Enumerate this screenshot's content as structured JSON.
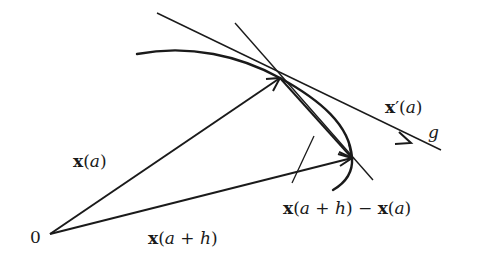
{
  "diagram": {
    "type": "vector-geometry",
    "stroke_color": "#1a1a1a",
    "points": {
      "origin": {
        "label": "0",
        "x": 50,
        "y": 234
      },
      "A": {
        "meaning": "x(a)",
        "x": 280,
        "y": 78
      },
      "B": {
        "meaning": "x(a+h)",
        "x": 352,
        "y": 158
      }
    },
    "labels": {
      "origin": "0",
      "x_a": {
        "bold": "x",
        "rest_pre": "(",
        "var": "a",
        "rest_post": ")"
      },
      "x_a_plus_h": {
        "bold": "x",
        "open": "(",
        "var1": "a",
        "op": " + ",
        "var2": "h",
        "close": ")"
      },
      "difference": {
        "bold1": "x",
        "open1": "(",
        "var1": "a",
        "op": " + ",
        "var2": "h",
        "close1": ")",
        "minus": " − ",
        "bold2": "x",
        "open2": "(",
        "var3": "a",
        "close2": ")"
      },
      "derivative": {
        "bold": "x",
        "prime": "′",
        "open": "(",
        "var": "a",
        "close": ")"
      },
      "tangent_line": "g"
    },
    "elements": [
      {
        "kind": "curve",
        "name": "curve-x"
      },
      {
        "kind": "arrow",
        "name": "vector-x-a",
        "from": "origin",
        "to": "A"
      },
      {
        "kind": "arrow",
        "name": "vector-x-a-plus-h",
        "from": "origin",
        "to": "B"
      },
      {
        "kind": "arrow",
        "name": "vector-difference",
        "from": "A",
        "to": "B"
      },
      {
        "kind": "line",
        "name": "tangent-line-g"
      },
      {
        "kind": "line",
        "name": "secant-line"
      },
      {
        "kind": "line",
        "name": "label-pointer"
      }
    ]
  }
}
